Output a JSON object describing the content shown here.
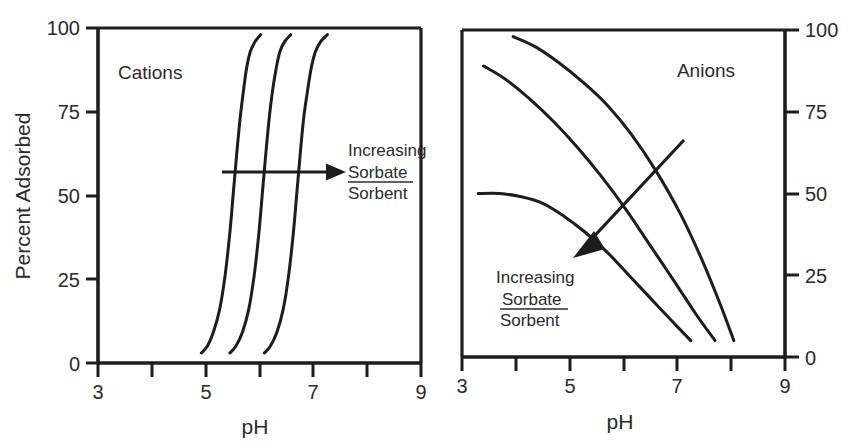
{
  "figure": {
    "background_color": "#ffffff",
    "ink_color": "#1d1d1d",
    "text_color": "#2b2b2b"
  },
  "chart_data": [
    {
      "type": "line",
      "panel_id": "cations",
      "title": "Cations",
      "xlabel": "pH",
      "ylabel": "Percent Adsorbed",
      "xlim": [
        3,
        9
      ],
      "ylim": [
        0,
        100
      ],
      "xticks": [
        3,
        4,
        5,
        6,
        7,
        8,
        9
      ],
      "xtick_labels": [
        "3",
        "",
        "5",
        "",
        "7",
        "",
        "9"
      ],
      "yticks": [
        0,
        25,
        50,
        75,
        100
      ],
      "ytick_labels": [
        "0",
        "25",
        "50",
        "75",
        "100"
      ],
      "ytick_side": "left",
      "grid": false,
      "legend": "none",
      "annotation": {
        "lines": [
          "Increasing",
          "Sorbate",
          "Sorbent"
        ],
        "fraction_numerator": "Sorbate",
        "fraction_denominator": "Sorbent",
        "arrow_direction": "right",
        "arrow_from_ph": 5.3,
        "arrow_to_ph": 7.45,
        "arrow_at_percent": 57
      },
      "series": [
        {
          "name": "low sorbate/sorbent ratio",
          "x": [
            4.92,
            5.03,
            5.14,
            5.26,
            5.36,
            5.45,
            5.52,
            5.58,
            5.64,
            5.7,
            5.76,
            5.83,
            5.92,
            6.02
          ],
          "y": [
            3,
            5,
            9,
            16,
            26,
            39,
            52,
            63,
            73,
            81,
            88,
            93,
            96,
            98
          ]
        },
        {
          "name": "medium sorbate/sorbent ratio",
          "x": [
            5.45,
            5.56,
            5.68,
            5.8,
            5.9,
            5.99,
            6.06,
            6.12,
            6.18,
            6.24,
            6.31,
            6.38,
            6.47,
            6.58
          ],
          "y": [
            3,
            5,
            9,
            16,
            26,
            39,
            52,
            63,
            73,
            81,
            88,
            93,
            96,
            98
          ]
        },
        {
          "name": "high sorbate/sorbent ratio",
          "x": [
            6.09,
            6.2,
            6.32,
            6.44,
            6.54,
            6.63,
            6.7,
            6.76,
            6.82,
            6.89,
            6.96,
            7.04,
            7.14,
            7.26
          ],
          "y": [
            3,
            5,
            9,
            16,
            26,
            39,
            52,
            63,
            73,
            81,
            88,
            93,
            96,
            98
          ]
        }
      ]
    },
    {
      "type": "line",
      "panel_id": "anions",
      "title": "Anions",
      "xlabel": "pH",
      "ylabel": "",
      "xlim": [
        3,
        9
      ],
      "ylim": [
        0,
        100
      ],
      "xticks": [
        3,
        4,
        5,
        6,
        7,
        8,
        9
      ],
      "xtick_labels": [
        "3",
        "",
        "5",
        "",
        "7",
        "",
        "9"
      ],
      "yticks": [
        0,
        25,
        50,
        75,
        100
      ],
      "ytick_labels": [
        "0",
        "25",
        "50",
        "75",
        "100"
      ],
      "ytick_side": "right",
      "grid": false,
      "legend": "none",
      "annotation": {
        "lines": [
          "Increasing",
          "Sorbate",
          "Sorbent"
        ],
        "fraction_numerator": "Sorbate",
        "fraction_denominator": "Sorbent",
        "arrow_direction": "down-left",
        "arrow_from_ph": 7.1,
        "arrow_from_percent": 67,
        "arrow_to_ph": 5.2,
        "arrow_to_percent": 35
      },
      "series": [
        {
          "name": "low sorbate/sorbent ratio",
          "x": [
            3.95,
            4.35,
            4.8,
            5.25,
            5.7,
            6.15,
            6.6,
            7.05,
            7.45,
            7.8,
            8.05
          ],
          "y": [
            98,
            95,
            90,
            84,
            77,
            68,
            57,
            44,
            30,
            16,
            5
          ]
        },
        {
          "name": "medium sorbate/sorbent ratio",
          "x": [
            3.4,
            3.8,
            4.25,
            4.7,
            5.15,
            5.6,
            6.05,
            6.5,
            6.95,
            7.35,
            7.7
          ],
          "y": [
            89,
            85,
            79,
            72,
            64,
            55,
            45,
            34,
            23,
            13,
            5
          ]
        },
        {
          "name": "high sorbate/sorbent ratio",
          "x": [
            3.3,
            3.7,
            4.1,
            4.5,
            4.9,
            5.3,
            5.7,
            6.1,
            6.5,
            6.9,
            7.25
          ],
          "y": [
            50,
            50,
            49,
            47,
            43,
            38,
            32,
            25,
            18,
            11,
            5
          ]
        }
      ]
    }
  ]
}
